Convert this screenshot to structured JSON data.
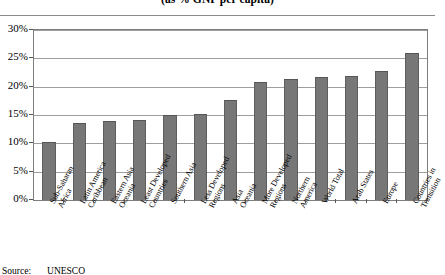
{
  "chart": {
    "title": "(as % GNP per capita)",
    "source_label": "Source:",
    "source_value": "UNESCO"
  },
  "chart_data": {
    "type": "bar",
    "title": "(as % GNP per capita)",
    "xlabel": "",
    "ylabel": "",
    "ylim": [
      0,
      30
    ],
    "ytick_labels": [
      "0%",
      "5%",
      "10%",
      "15%",
      "20%",
      "25%",
      "30%"
    ],
    "ytick_values": [
      0,
      5,
      10,
      15,
      20,
      25,
      30
    ],
    "grid": true,
    "legend": "none",
    "bar_color": "#777777",
    "categories": [
      "Sub-Saharan Africa",
      "Latin America Caribbean",
      "Eastern Asia Oceania",
      "Least Developed Countries",
      "Southern Asia",
      "Less Developed Regions",
      "Asia Oceania",
      "More Developed Regions",
      "Northern America",
      "World Total",
      "Arab States",
      "Europe",
      "Countries in Transition"
    ],
    "category_lines": [
      [
        "Sub-Saharan",
        "Africa"
      ],
      [
        "Latin America",
        "Caribbean"
      ],
      [
        "Eastern Asia",
        "Oceania"
      ],
      [
        "Least Developed",
        "Countries"
      ],
      [
        "Southern Asia",
        ""
      ],
      [
        "Less Developed",
        "Regions"
      ],
      [
        "Asia",
        "Oceania"
      ],
      [
        "More Developed",
        "Regions"
      ],
      [
        "Northern",
        "America"
      ],
      [
        "World Total",
        ""
      ],
      [
        "Arab States",
        ""
      ],
      [
        "Europe",
        ""
      ],
      [
        "Countries in",
        "Transition"
      ]
    ],
    "values": [
      10.3,
      13.6,
      14.0,
      14.1,
      15.0,
      15.2,
      17.7,
      20.8,
      21.3,
      21.7,
      21.8,
      22.8,
      26.0
    ]
  }
}
